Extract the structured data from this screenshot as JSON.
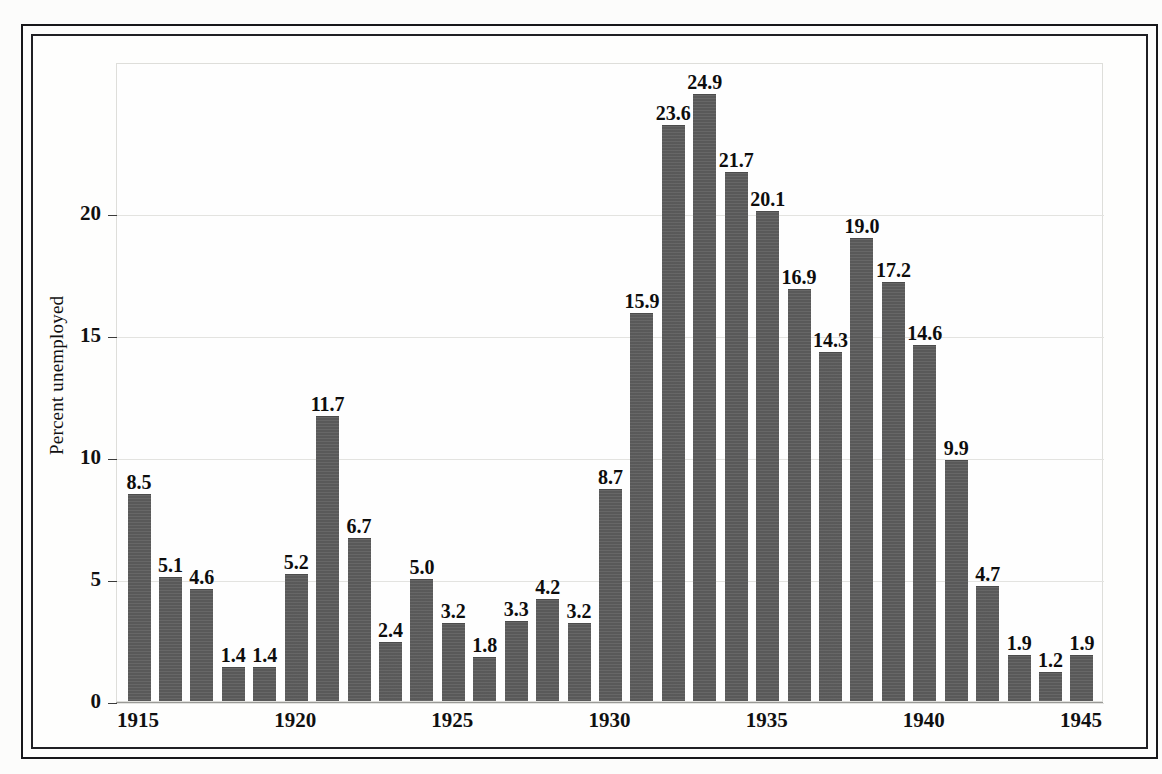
{
  "chart_data": {
    "type": "bar",
    "title": "",
    "xlabel": "",
    "ylabel": "Percent unemployed",
    "ylim": [
      0,
      26.2
    ],
    "xlim": [
      1914.3,
      1945.7
    ],
    "grid": true,
    "legend": null,
    "bar_color": "#5e5e5e",
    "value_labels_shown": true,
    "y_ticks": [
      "0",
      "5",
      "10",
      "15",
      "20"
    ],
    "y_tick_values": [
      0,
      5,
      10,
      15,
      20
    ],
    "x_ticks": [
      "1915",
      "1920",
      "1925",
      "1930",
      "1935",
      "1940",
      "1945"
    ],
    "x_tick_values": [
      1915,
      1920,
      1925,
      1930,
      1935,
      1940,
      1945
    ],
    "categories": [
      "1915",
      "1916",
      "1917",
      "1918",
      "1919",
      "1920",
      "1921",
      "1922",
      "1923",
      "1924",
      "1925",
      "1926",
      "1927",
      "1928",
      "1929",
      "1930",
      "1931",
      "1932",
      "1933",
      "1934",
      "1935",
      "1936",
      "1937",
      "1938",
      "1939",
      "1940",
      "1941",
      "1942",
      "1943",
      "1944",
      "1945"
    ],
    "values": [
      8.5,
      5.1,
      4.6,
      1.4,
      1.4,
      5.2,
      11.7,
      6.7,
      2.4,
      5.0,
      3.2,
      1.8,
      3.3,
      4.2,
      3.2,
      8.7,
      15.9,
      23.6,
      24.9,
      21.7,
      20.1,
      16.9,
      14.3,
      19.0,
      17.2,
      14.6,
      9.9,
      4.7,
      1.9,
      1.2,
      1.9
    ],
    "value_labels": [
      "8.5",
      "5.1",
      "4.6",
      "1.4",
      "1.4",
      "5.2",
      "11.7",
      "6.7",
      "2.4",
      "5.0",
      "3.2",
      "1.8",
      "3.3",
      "4.2",
      "3.2",
      "8.7",
      "15.9",
      "23.6",
      "24.9",
      "21.7",
      "20.1",
      "16.9",
      "14.3",
      "19.0",
      "17.2",
      "14.6",
      "9.9",
      "4.7",
      "1.9",
      "1.2",
      "1.9"
    ]
  }
}
